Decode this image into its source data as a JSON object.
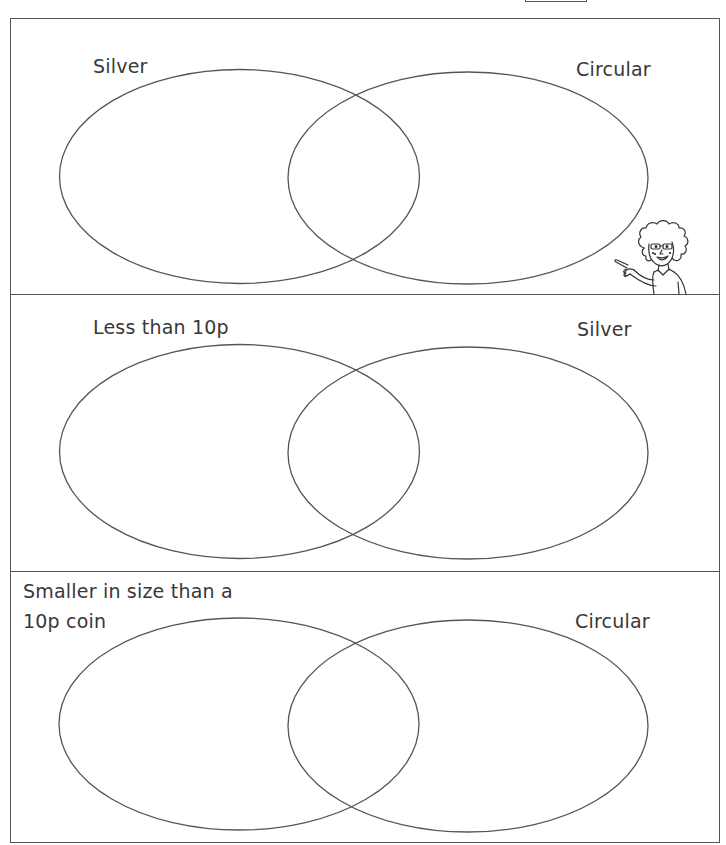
{
  "worksheet": {
    "panels": [
      {
        "left_set_label": "Silver",
        "right_set_label": "Circular"
      },
      {
        "left_set_label": "Less than 10p",
        "right_set_label": "Silver"
      },
      {
        "left_set_label_line1": "Smaller in size than a",
        "left_set_label_line2": "10p coin",
        "right_set_label": "Circular"
      }
    ],
    "illustration": "teacher-pointing-icon",
    "colors": {
      "line": "#555555",
      "text": "#383838",
      "background": "#ffffff"
    }
  }
}
